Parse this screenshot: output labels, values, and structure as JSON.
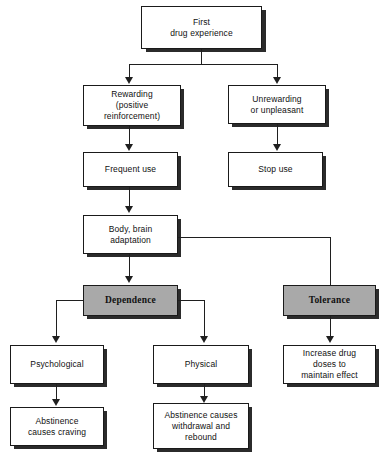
{
  "figure": {
    "type": "flowchart",
    "title": "",
    "background_color": "#ffffff",
    "box_fill_plain": "#ffffff",
    "box_fill_emphasis": "#a9a9a9",
    "border_color": "#1a1a1a",
    "shadow_color": "#2b2b2b",
    "connector_color": "#1f1f1f"
  },
  "nodes": {
    "first_drug_experience": {
      "label": "First\ndrug experience",
      "emphasis": false
    },
    "rewarding": {
      "label": "Rewarding\n(positive\nreinforcement)",
      "emphasis": false
    },
    "unrewarding": {
      "label": "Unrewarding\nor unpleasant",
      "emphasis": false
    },
    "frequent_use": {
      "label": "Frequent use",
      "emphasis": false
    },
    "stop_use": {
      "label": "Stop use",
      "emphasis": false
    },
    "body_brain_adaptation": {
      "label": "Body, brain\nadaptation",
      "emphasis": false
    },
    "dependence": {
      "label": "Dependence",
      "emphasis": true
    },
    "tolerance": {
      "label": "Tolerance",
      "emphasis": true
    },
    "psychological": {
      "label": "Psychological",
      "emphasis": false
    },
    "physical": {
      "label": "Physical",
      "emphasis": false
    },
    "increase_drug_doses": {
      "label": "Increase drug\ndoses to\nmaintain effect",
      "emphasis": false
    },
    "abstinence_craving": {
      "label": "Abstinence\ncauses craving",
      "emphasis": false
    },
    "abstinence_withdrawal": {
      "label": "Abstinence causes\nwithdrawal and\nrebound",
      "emphasis": false
    }
  },
  "edges": [
    {
      "from": "first_drug_experience",
      "to": "rewarding"
    },
    {
      "from": "first_drug_experience",
      "to": "unrewarding"
    },
    {
      "from": "rewarding",
      "to": "frequent_use"
    },
    {
      "from": "unrewarding",
      "to": "stop_use"
    },
    {
      "from": "frequent_use",
      "to": "body_brain_adaptation"
    },
    {
      "from": "body_brain_adaptation",
      "to": "dependence"
    },
    {
      "from": "body_brain_adaptation",
      "to": "tolerance"
    },
    {
      "from": "dependence",
      "to": "psychological"
    },
    {
      "from": "dependence",
      "to": "physical"
    },
    {
      "from": "tolerance",
      "to": "increase_drug_doses"
    },
    {
      "from": "psychological",
      "to": "abstinence_craving"
    },
    {
      "from": "physical",
      "to": "abstinence_withdrawal"
    }
  ]
}
